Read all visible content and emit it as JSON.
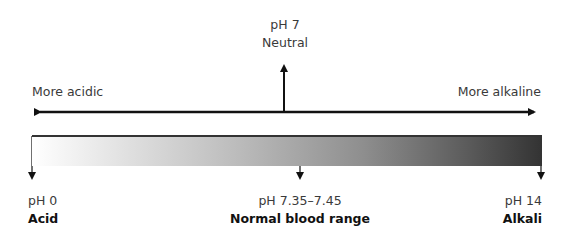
{
  "top": {
    "neutral_ph": "pH 7",
    "neutral_label": "Neutral",
    "left_direction": "More acidic",
    "right_direction": "More alkaline"
  },
  "scale": {
    "gradient_start_color": "#ffffff",
    "gradient_end_color": "#333333",
    "markers": [
      {
        "ph": "pH 0",
        "label": "Acid"
      },
      {
        "ph": "pH 7.35–7.45",
        "label": "Normal blood range"
      },
      {
        "ph": "pH 14",
        "label": "Alkali"
      }
    ]
  }
}
